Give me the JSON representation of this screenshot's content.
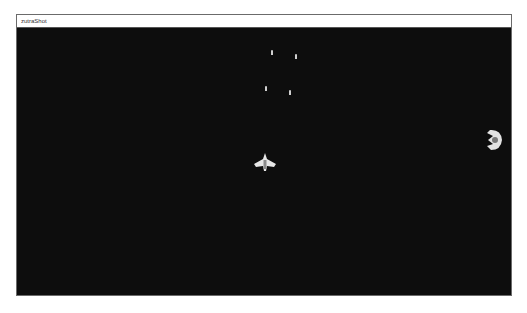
{
  "window": {
    "title": "zutraShot"
  },
  "game": {
    "player": {
      "x": 264,
      "y": 163,
      "icon": "player-ship-icon"
    },
    "enemy": {
      "x": 494,
      "y": 140,
      "icon": "enemy-ship-icon"
    },
    "bullets": [
      {
        "x": 272,
        "y": 52
      },
      {
        "x": 296,
        "y": 56
      },
      {
        "x": 266,
        "y": 88
      },
      {
        "x": 290,
        "y": 92
      }
    ],
    "colors": {
      "background": "#0d0d0d",
      "sprite": "#e0e0e0"
    }
  }
}
